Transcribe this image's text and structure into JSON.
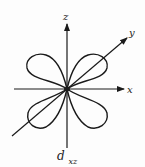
{
  "diagram": {
    "orbital_label": {
      "main": "d",
      "subscript": "xz"
    },
    "axes": {
      "x": {
        "label": "x"
      },
      "y": {
        "label": "y"
      },
      "z": {
        "label": "z"
      }
    },
    "lobes": [
      {
        "position": "upper-left"
      },
      {
        "position": "upper-right"
      },
      {
        "position": "lower-left"
      },
      {
        "position": "lower-right"
      }
    ],
    "colors": {
      "stroke": "#1a1a1a",
      "background": "#fdfdfd",
      "text": "#222222"
    }
  }
}
